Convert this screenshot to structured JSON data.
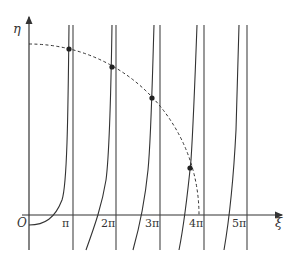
{
  "figure": {
    "y_axis_label": "η",
    "x_axis_label": "ξ",
    "origin_label": "O",
    "x_ticks": [
      {
        "label": "π",
        "x": 73
      },
      {
        "label": "2π",
        "x": 116
      },
      {
        "label": "3π",
        "x": 160
      },
      {
        "label": "4π",
        "x": 204
      },
      {
        "label": "5π",
        "x": 247
      }
    ],
    "intersection_points": [
      {
        "x": 69,
        "y": 49
      },
      {
        "x": 112,
        "y": 67
      },
      {
        "x": 152,
        "y": 98
      },
      {
        "x": 190,
        "y": 168
      }
    ],
    "colors": {
      "line": "#333333",
      "background": "#ffffff"
    }
  }
}
